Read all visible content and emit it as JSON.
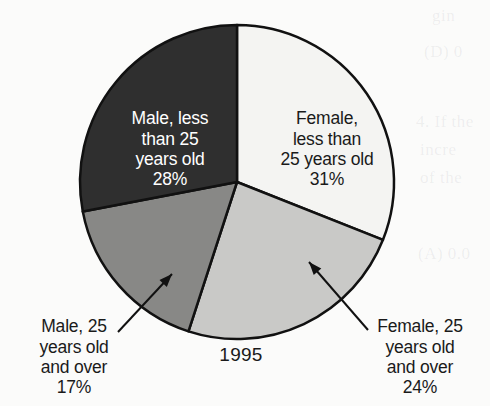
{
  "background_color": "#fbfbfa",
  "year_label": "1995",
  "chart_data": {
    "type": "pie",
    "title": "",
    "subtitle": "",
    "xlabel": "",
    "ylabel": "",
    "year": "1995",
    "legend_position": "none",
    "grid": false,
    "units": "percent",
    "total": 100,
    "start_angle_deg": 0,
    "direction": "clockwise",
    "categories": [
      "Female, less than 25 years old",
      "Female, 25 years old and over",
      "Male, 25 years old and over",
      "Male, less than 25 years old"
    ],
    "values": [
      31,
      24,
      17,
      28
    ],
    "labels": [
      "31%",
      "24%",
      "17%",
      "28%"
    ],
    "colors": [
      "#f4f4f2",
      "#c9c9c7",
      "#888886",
      "#2f2f2f"
    ],
    "slices": [
      {
        "id": "female-lt25",
        "name": "Female, less than 25 years old",
        "label_lines": "Female,\nless than\n25 years old",
        "percent_text": "31%",
        "value": 31,
        "color": "#f4f4f2",
        "text_color": "#1a1a1a",
        "start_deg": 0,
        "end_deg": 111.6,
        "label_placement": "inside"
      },
      {
        "id": "female-ge25",
        "name": "Female, 25 years old and over",
        "label_lines": "Female, 25\nyears old\nand over",
        "percent_text": "24%",
        "value": 24,
        "color": "#c9c9c7",
        "text_color": "#1a1a1a",
        "start_deg": 111.6,
        "end_deg": 198.0,
        "label_placement": "callout-right"
      },
      {
        "id": "male-ge25",
        "name": "Male, 25 years old and over",
        "label_lines": "Male, 25\nyears old\nand over",
        "percent_text": "17%",
        "value": 17,
        "color": "#888886",
        "text_color": "#1a1a1a",
        "start_deg": 198.0,
        "end_deg": 259.2,
        "label_placement": "callout-left"
      },
      {
        "id": "male-lt25",
        "name": "Male, less than 25 years old",
        "label_lines": "Male, less\nthan 25\nyears old",
        "percent_text": "28%",
        "value": 28,
        "color": "#2f2f2f",
        "text_color": "#ffffff",
        "start_deg": 259.2,
        "end_deg": 360.0,
        "label_placement": "inside"
      }
    ],
    "geometry": {
      "center_x": 237,
      "center_y": 182,
      "radius": 157,
      "stroke_color": "#111111",
      "stroke_width": 2.5
    },
    "annotations": [
      {
        "id": "leader-male-ge25",
        "target_slice": "male-ge25",
        "arrow": true,
        "tail_x": 118,
        "tail_y": 332,
        "tip_x": 172,
        "tip_y": 274
      },
      {
        "id": "leader-female-ge25",
        "target_slice": "female-ge25",
        "arrow": true,
        "tail_x": 368,
        "tail_y": 330,
        "tip_x": 309,
        "tip_y": 262
      }
    ]
  },
  "background_bleed": [
    "gin",
    "(D) 0",
    "4. If the",
    "incre",
    "of the",
    "(A) 0.0"
  ]
}
